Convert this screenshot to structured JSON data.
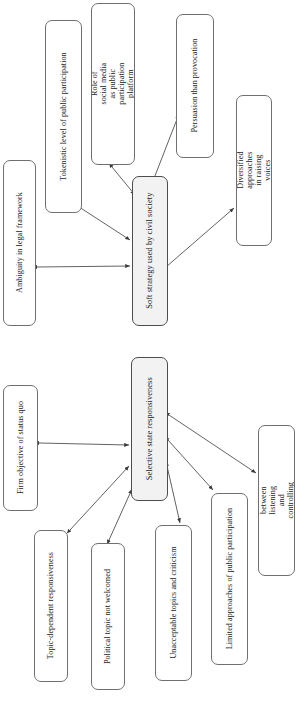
{
  "diagram": {
    "orientation": "text-rotated-90-ccw",
    "style": {
      "node_border_color": "#6f6f6f",
      "node_fill_color": "#ffffff",
      "accent_node_fill_color": "#f2f2f2",
      "edge_color": "#3a3a3a",
      "background_color": "#ffffff",
      "text_color": "#1a1a1a"
    },
    "clusters": [
      {
        "id": "cluster-soft-strategy",
        "hub": "node-soft-strategy"
      },
      {
        "id": "cluster-selective-responsiveness",
        "hub": "node-selective-state-responsiveness"
      }
    ],
    "nodes": [
      {
        "id": "node-ambiguity-legal-framework",
        "label": "Ambiguity in legal framework",
        "lines": [
          "Ambiguity in legal framework"
        ],
        "cluster": "cluster-soft-strategy",
        "accent": false,
        "x": 3,
        "y": 160,
        "w": 33,
        "h": 166,
        "font_size": 8.1
      },
      {
        "id": "node-tokenistic-participation",
        "label": "Tokenistic level of public participation",
        "lines": [
          "Tokenistic level of public participation"
        ],
        "cluster": "cluster-soft-strategy",
        "accent": false,
        "x": 45,
        "y": 20,
        "w": 37,
        "h": 193,
        "font_size": 8.1
      },
      {
        "id": "node-role-social-media",
        "label": "Role of social media as public participation platform",
        "lines": [
          "Role of social media as public",
          "participation platform"
        ],
        "cluster": "cluster-soft-strategy",
        "accent": false,
        "x": 91,
        "y": 3,
        "w": 44,
        "h": 162,
        "font_size": 8.1
      },
      {
        "id": "node-soft-strategy",
        "label": "Soft strategy used by civil society",
        "lines": [
          "Soft strategy used by civil society"
        ],
        "cluster": "cluster-soft-strategy",
        "accent": true,
        "x": 132,
        "y": 176,
        "w": 36,
        "h": 150,
        "font_size": 8.4
      },
      {
        "id": "node-persuasion-provocation",
        "label": "Persuasion than provocation",
        "lines": [
          "Persuasion than provocation"
        ],
        "cluster": "cluster-soft-strategy",
        "accent": false,
        "x": 176,
        "y": 14,
        "w": 38,
        "h": 144,
        "font_size": 8.1
      },
      {
        "id": "node-diversified-approaches",
        "label": "Diversified approaches in raising voices",
        "lines": [
          "Diversified approaches in raising",
          "voices"
        ],
        "cluster": "cluster-soft-strategy",
        "accent": false,
        "x": 236,
        "y": 95,
        "w": 36,
        "h": 151,
        "font_size": 8.1
      },
      {
        "id": "node-firm-objective-status-quo",
        "label": "Firm objective of status quo",
        "lines": [
          "Firm objective of status quo"
        ],
        "cluster": "cluster-selective-responsiveness",
        "accent": false,
        "x": 3,
        "y": 385,
        "w": 35,
        "h": 126,
        "font_size": 8.1
      },
      {
        "id": "node-selective-state-responsiveness",
        "label": "Selective state responsiveness",
        "lines": [
          "Selective state responsiveness"
        ],
        "cluster": "cluster-selective-responsiveness",
        "accent": true,
        "x": 131,
        "y": 357,
        "w": 37,
        "h": 144,
        "font_size": 8.4
      },
      {
        "id": "node-topic-dependent-responsiveness",
        "label": "Topic-dependent responsiveness",
        "lines": [
          "Topic-dependent responsiveness"
        ],
        "cluster": "cluster-selective-responsiveness",
        "accent": false,
        "x": 34,
        "y": 530,
        "w": 34,
        "h": 152,
        "font_size": 8.1
      },
      {
        "id": "node-political-topic-not-welcomed",
        "label": "Political topic not welcomed",
        "lines": [
          "Political topic not welcomed"
        ],
        "cluster": "cluster-selective-responsiveness",
        "accent": false,
        "x": 91,
        "y": 543,
        "w": 34,
        "h": 147,
        "font_size": 8.1
      },
      {
        "id": "node-unacceptable-topics-criticism",
        "label": "Unacceptable topics and criticism",
        "lines": [
          "Unacceptable topics and criticism"
        ],
        "cluster": "cluster-selective-responsiveness",
        "accent": false,
        "x": 155,
        "y": 525,
        "w": 37,
        "h": 156,
        "font_size": 8.1
      },
      {
        "id": "node-limited-approaches-participation",
        "label": "Limited approaches of public participation",
        "lines": [
          "Limited approaches of public participation"
        ],
        "cluster": "cluster-selective-responsiveness",
        "accent": false,
        "x": 211,
        "y": 493,
        "w": 37,
        "h": 172,
        "font_size": 8.1
      },
      {
        "id": "node-contradiction-listening-controlling",
        "label": "Contradiction between listening and controlling public voices",
        "lines": [
          "Contradiction between listening",
          "and controlling public voices"
        ],
        "cluster": "cluster-selective-responsiveness",
        "accent": false,
        "x": 258,
        "y": 425,
        "w": 37,
        "h": 151,
        "font_size": 8.1
      }
    ],
    "edges": [
      {
        "id": "edge-ambiguity-soft",
        "from": "node-ambiguity-legal-framework",
        "to": "node-soft-strategy",
        "arrows": "both",
        "x1": 37,
        "y1": 267,
        "x2": 130,
        "y2": 266
      },
      {
        "id": "edge-tokenistic-soft",
        "from": "node-tokenistic-participation",
        "to": "node-soft-strategy",
        "arrows": "both",
        "x1": 76,
        "y1": 205,
        "x2": 130,
        "y2": 240
      },
      {
        "id": "edge-socialmedia-soft",
        "from": "node-role-social-media",
        "to": "node-soft-strategy",
        "arrows": "both",
        "x1": 112,
        "y1": 167,
        "x2": 135,
        "y2": 195
      },
      {
        "id": "edge-soft-persuasion",
        "from": "node-soft-strategy",
        "to": "node-persuasion-provocation",
        "arrows": "both",
        "x1": 153,
        "y1": 181,
        "x2": 179,
        "y2": 114
      },
      {
        "id": "edge-soft-diversified",
        "from": "node-soft-strategy",
        "to": "node-diversified-approaches",
        "arrows": "both",
        "x1": 166,
        "y1": 267,
        "x2": 234,
        "y2": 208
      },
      {
        "id": "edge-firm-selective",
        "from": "node-firm-objective-status-quo",
        "to": "node-selective-state-responsiveness",
        "arrows": "both",
        "x1": 39,
        "y1": 443,
        "x2": 129,
        "y2": 445
      },
      {
        "id": "edge-topic-selective",
        "from": "node-topic-dependent-responsiveness",
        "to": "node-selective-state-responsiveness",
        "arrows": "both",
        "x1": 70,
        "y1": 530,
        "x2": 129,
        "y2": 466
      },
      {
        "id": "edge-political-selective",
        "from": "node-political-topic-not-welcomed",
        "to": "node-selective-state-responsiveness",
        "arrows": "both",
        "x1": 109,
        "y1": 540,
        "x2": 132,
        "y2": 489
      },
      {
        "id": "edge-unacceptable-selective",
        "from": "node-selective-state-responsiveness",
        "to": "node-unacceptable-topics-criticism",
        "arrows": "both",
        "x1": 167,
        "y1": 466,
        "x2": 180,
        "y2": 523
      },
      {
        "id": "edge-limited-selective",
        "from": "node-selective-state-responsiveness",
        "to": "node-limited-approaches-participation",
        "arrows": "both",
        "x1": 168,
        "y1": 440,
        "x2": 213,
        "y2": 490
      },
      {
        "id": "edge-contradiction-selective",
        "from": "node-selective-state-responsiveness",
        "to": "node-contradiction-listening-controlling",
        "arrows": "both",
        "x1": 169,
        "y1": 415,
        "x2": 256,
        "y2": 473
      }
    ]
  }
}
